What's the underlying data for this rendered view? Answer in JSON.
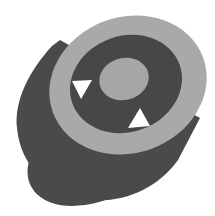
{
  "figure": {
    "title": "Cylindrical ring with center disc",
    "shapes": {
      "cylinder_body": {
        "color": "#4a4a4a"
      },
      "outer_ring_face": {
        "color": "#a9a9a9"
      },
      "inner_recess": {
        "color": "#474747"
      },
      "center_disc": {
        "color": "#a6a6a6"
      },
      "openings": {
        "color": "#ffffff",
        "count": 2
      }
    },
    "background": "#ffffff"
  }
}
